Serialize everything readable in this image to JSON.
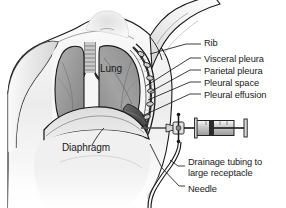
{
  "figure": {
    "type": "medical-illustration",
    "style": "grayscale line-and-wash anatomical drawing",
    "background_color": "#ffffff",
    "ink_color": "#1a1a1a",
    "view": "anterior thorax cutaway, patient seated, right arm raised"
  },
  "labels": [
    {
      "id": "rib",
      "text": "Rib",
      "x": 204,
      "y": 44,
      "leader": true
    },
    {
      "id": "visceral-pleura",
      "text": "Visceral pleura",
      "x": 204,
      "y": 60,
      "leader": true
    },
    {
      "id": "parietal-pleura",
      "text": "Parietal pleura",
      "x": 204,
      "y": 72,
      "leader": true
    },
    {
      "id": "pleural-space",
      "text": "Pleural space",
      "x": 204,
      "y": 84,
      "leader": true
    },
    {
      "id": "pleural-effusion",
      "text": "Pleural effusion",
      "x": 204,
      "y": 96,
      "leader": true
    },
    {
      "id": "lung",
      "text": "Lung",
      "x": 100,
      "y": 69,
      "leader": false
    },
    {
      "id": "diaphragm",
      "text": "Diaphragm",
      "x": 62,
      "y": 148,
      "leader": true
    },
    {
      "id": "drainage-line-1",
      "text": "Drainage tubing to",
      "x": 188,
      "y": 162,
      "leader": true
    },
    {
      "id": "drainage-line-2",
      "text": "large receptacle",
      "x": 188,
      "y": 173,
      "leader": false
    },
    {
      "id": "needle",
      "text": "Needle",
      "x": 188,
      "y": 189,
      "leader": true
    }
  ],
  "anatomy": {
    "structures": [
      "torso",
      "raised-right-arm",
      "neck",
      "clavicle",
      "trachea",
      "left-lung",
      "right-lung",
      "diaphragm",
      "ribcage",
      "visceral-pleura",
      "parietal-pleura",
      "pleural-space",
      "pleural-effusion"
    ]
  },
  "equipment": {
    "items": [
      "needle",
      "three-way-stopcock",
      "syringe-barrel",
      "syringe-plunger",
      "drainage-tubing"
    ],
    "insertion_site": "posterior-lateral chest wall, below effusion level"
  },
  "palette": {
    "skin_light": "#f2f2f2",
    "skin_mid": "#d8d8d8",
    "skin_shadow": "#b9b9b9",
    "lung_fill": "#9d9d9d",
    "lung_dark": "#7b7b7b",
    "effusion": "#555555",
    "outline": "#1a1a1a",
    "metal_light": "#e8e8e8",
    "metal_dark": "#4a4a4a"
  }
}
